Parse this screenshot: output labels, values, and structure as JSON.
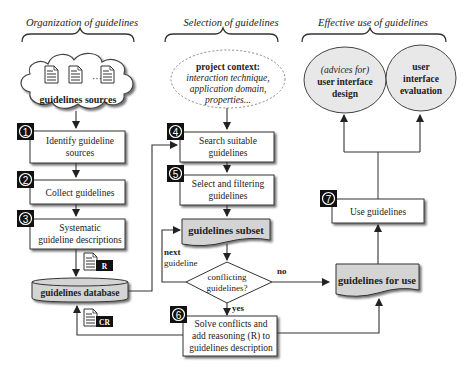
{
  "sections": {
    "organization": "Organization of guidelines",
    "selection": "Selection of guidelines",
    "effective_use": "Effective use of guidelines"
  },
  "sources": {
    "label": "guidelines sources"
  },
  "steps": [
    {
      "num": "1",
      "lines": [
        "Identify guideline",
        "sources"
      ]
    },
    {
      "num": "2",
      "lines": [
        "Collect guidelines"
      ]
    },
    {
      "num": "3",
      "lines": [
        "Systematic",
        "guideline descriptions"
      ]
    },
    {
      "num": "4",
      "lines": [
        "Search suitable",
        "guidelines"
      ]
    },
    {
      "num": "5",
      "lines": [
        "Select and filtering",
        "guidelines"
      ]
    },
    {
      "num": "6",
      "lines": [
        "Solve conflicts and",
        "add reasoning (R) to",
        "guidelines description"
      ]
    },
    {
      "num": "7",
      "lines": [
        "Use guidelines"
      ]
    }
  ],
  "database": {
    "label": "guidelines database"
  },
  "doc_tags": {
    "r": "R",
    "cr": "CR"
  },
  "context": {
    "title": "project context:",
    "lines": [
      "interaction technique,",
      "application domain,",
      "properties..."
    ]
  },
  "subset": {
    "label": "guidelines subset"
  },
  "decision": {
    "lines": [
      "conflicting",
      "guidelines?"
    ],
    "yes": "yes",
    "no": "no"
  },
  "next_guideline": {
    "bold": "next",
    "normal": "guideline"
  },
  "for_use": {
    "label": "guidelines for use"
  },
  "outcomes": {
    "design": {
      "italic": "(advices for)",
      "lines": [
        "user interface",
        "design"
      ]
    },
    "evaluation": {
      "lines": [
        "user",
        "interface",
        "evaluation"
      ]
    }
  },
  "colors": {
    "gray_fill": "#d4d4d4",
    "stroke": "#333333",
    "badge": "#111111"
  }
}
